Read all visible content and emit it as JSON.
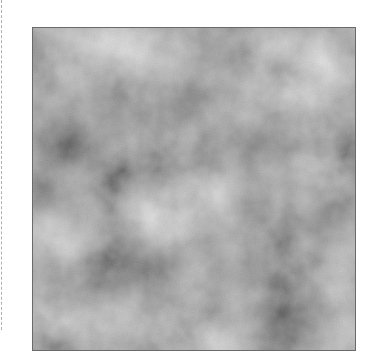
{
  "image": {
    "kind": "grayscale cloud noise texture",
    "icon": "noise-texture-image",
    "base_gray": "#8e8e8e",
    "light_gray": "#e8e8e8",
    "dark_gray": "#3c3c3c",
    "border_color": "#6a6a6a",
    "guide_color": "#b0b0b0",
    "blobs": [
      {
        "cx": 0.81,
        "cy": 0.15,
        "r": 0.16,
        "tone": "light"
      },
      {
        "cx": 0.15,
        "cy": 0.08,
        "r": 0.12,
        "tone": "light"
      },
      {
        "cx": 0.46,
        "cy": 0.25,
        "r": 0.1,
        "tone": "dark"
      },
      {
        "cx": 0.1,
        "cy": 0.36,
        "r": 0.11,
        "tone": "dark"
      },
      {
        "cx": 0.67,
        "cy": 0.39,
        "r": 0.14,
        "tone": "dark"
      },
      {
        "cx": 0.04,
        "cy": 0.53,
        "r": 0.09,
        "tone": "dark"
      },
      {
        "cx": 0.39,
        "cy": 0.59,
        "r": 0.13,
        "tone": "light"
      },
      {
        "cx": 0.96,
        "cy": 0.61,
        "r": 0.1,
        "tone": "dark"
      },
      {
        "cx": 0.35,
        "cy": 0.74,
        "r": 0.11,
        "tone": "dark"
      },
      {
        "cx": 0.82,
        "cy": 0.91,
        "r": 0.13,
        "tone": "dark"
      },
      {
        "cx": 0.06,
        "cy": 0.92,
        "r": 0.11,
        "tone": "light"
      },
      {
        "cx": 0.53,
        "cy": 0.97,
        "r": 0.1,
        "tone": "light"
      },
      {
        "cx": 0.06,
        "cy": 0.68,
        "r": 0.09,
        "tone": "light"
      },
      {
        "cx": 0.3,
        "cy": 0.05,
        "r": 0.09,
        "tone": "light"
      },
      {
        "cx": 0.92,
        "cy": 0.45,
        "r": 0.08,
        "tone": "light"
      },
      {
        "cx": 0.62,
        "cy": 0.75,
        "r": 0.09,
        "tone": "dark"
      },
      {
        "cx": 0.22,
        "cy": 0.28,
        "r": 0.08,
        "tone": "dark"
      },
      {
        "cx": 0.55,
        "cy": 0.5,
        "r": 0.09,
        "tone": "light"
      }
    ]
  }
}
